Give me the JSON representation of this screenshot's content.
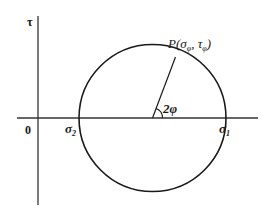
{
  "diagram": {
    "axes": {
      "vertical_label": "τ",
      "origin_label": "0"
    },
    "circle": {
      "left_label": "σ",
      "left_sub": "2",
      "right_label": "σ",
      "right_sub": "1"
    },
    "point": {
      "label_prefix": "P(",
      "sigma": "σ",
      "sigma_sub": "φ",
      "comma": ", ",
      "tau": "τ",
      "tau_sub": "φ",
      "label_suffix": ")"
    },
    "angle": {
      "label": "2φ"
    },
    "colors": {
      "stroke": "#1a1a1a",
      "axis": "#333333",
      "background": "#ffffff"
    }
  }
}
